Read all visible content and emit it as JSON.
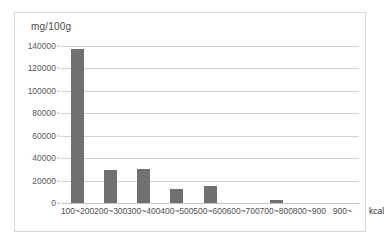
{
  "chart_data": {
    "type": "bar",
    "title": "",
    "subtitle": "",
    "ylabel": "mg/100g",
    "xlabel": "kcal",
    "categories": [
      "100~200",
      "200~300",
      "300~400",
      "400~500",
      "500~600",
      "600~700",
      "700~800",
      "800~900",
      "900~"
    ],
    "values": [
      137000,
      29500,
      30500,
      12500,
      15000,
      0,
      2500,
      0,
      0
    ],
    "ylim": [
      0,
      140000
    ],
    "yticks": [
      0,
      20000,
      40000,
      60000,
      80000,
      100000,
      120000,
      140000
    ],
    "ytick_labels": [
      "0",
      "20000",
      "40000",
      "60000",
      "80000",
      "100000",
      "120000",
      "140000"
    ],
    "grid": true,
    "legend": false,
    "series": [
      {
        "name": "",
        "values": [
          137000,
          29500,
          30500,
          12500,
          15000,
          0,
          2500,
          0,
          0
        ]
      }
    ],
    "colors": {
      "bar": "#717070",
      "gridline": "#d2d2d2",
      "frame": "#d8d8d8",
      "text": "#4f4f4f",
      "background": "#ffffff"
    }
  }
}
